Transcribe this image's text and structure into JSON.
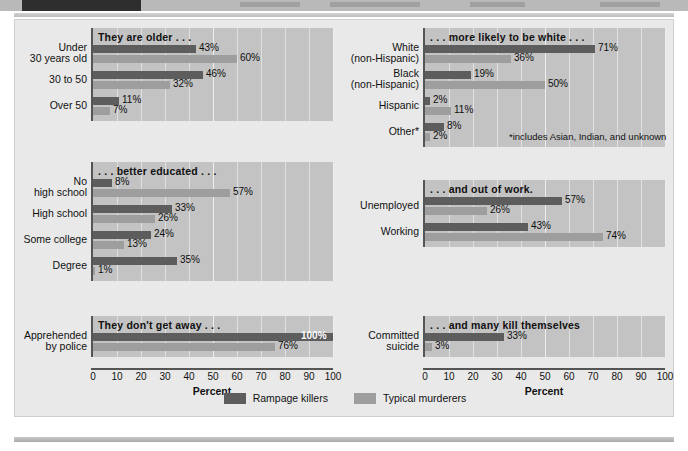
{
  "banner": {
    "title_unreadable": ""
  },
  "chart_data": {
    "type": "bar",
    "title": "",
    "xlabel": "Percent",
    "ylabel": "",
    "xlim": [
      0,
      100
    ],
    "grid": true,
    "orientation": "horizontal",
    "legend_position": "bottom-center",
    "series": [
      {
        "name": "Rampage killers",
        "color": "#5d5d5d"
      },
      {
        "name": "Typical murderers",
        "color": "#9e9e9e"
      }
    ],
    "ticks": [
      "0",
      "10",
      "20",
      "30",
      "40",
      "50",
      "60",
      "70",
      "80",
      "90",
      "100"
    ],
    "panels": [
      {
        "id": "age",
        "column": "left",
        "section_title": "They are older . . .",
        "categories": [
          {
            "label_lines": [
              "Under",
              "30 years old"
            ],
            "rampage": 43,
            "typical": 60,
            "rampage_text": "43%",
            "typical_text": "60%"
          },
          {
            "label_lines": [
              "30 to 50"
            ],
            "rampage": 46,
            "typical": 32,
            "rampage_text": "46%",
            "typical_text": "32%"
          },
          {
            "label_lines": [
              "Over 50"
            ],
            "rampage": 11,
            "typical": 7,
            "rampage_text": "11%",
            "typical_text": "7%"
          }
        ]
      },
      {
        "id": "education",
        "column": "left",
        "section_title": ". . . better educated . . .",
        "categories": [
          {
            "label_lines": [
              "No",
              "high school"
            ],
            "rampage": 8,
            "typical": 57,
            "rampage_text": "8%",
            "typical_text": "57%"
          },
          {
            "label_lines": [
              "High school"
            ],
            "rampage": 33,
            "typical": 26,
            "rampage_text": "33%",
            "typical_text": "26%"
          },
          {
            "label_lines": [
              "Some college"
            ],
            "rampage": 24,
            "typical": 13,
            "rampage_text": "24%",
            "typical_text": "13%"
          },
          {
            "label_lines": [
              "Degree"
            ],
            "rampage": 35,
            "typical": 1,
            "rampage_text": "35%",
            "typical_text": "1%"
          }
        ]
      },
      {
        "id": "apprehension",
        "column": "left",
        "section_title": "They don't get away . . .",
        "categories": [
          {
            "label_lines": [
              "Apprehended",
              "by police"
            ],
            "rampage": 100,
            "typical": 76,
            "rampage_text": "100%",
            "typical_text": "76%",
            "rampage_label_inside": true
          }
        ]
      },
      {
        "id": "race",
        "column": "right",
        "section_title": ". . . more likely to be white . . .",
        "footnote": "*includes Asian, Indian, and unknown",
        "categories": [
          {
            "label_lines": [
              "White",
              "(non-Hispanic)"
            ],
            "rampage": 71,
            "typical": 36,
            "rampage_text": "71%",
            "typical_text": "36%"
          },
          {
            "label_lines": [
              "Black",
              "(non-Hispanic)"
            ],
            "rampage": 19,
            "typical": 50,
            "rampage_text": "19%",
            "typical_text": "50%"
          },
          {
            "label_lines": [
              "Hispanic"
            ],
            "rampage": 2,
            "typical": 11,
            "rampage_text": "2%",
            "typical_text": "11%"
          },
          {
            "label_lines": [
              "Other*"
            ],
            "rampage": 8,
            "typical": 2,
            "rampage_text": "8%",
            "typical_text": "2%"
          }
        ]
      },
      {
        "id": "employment",
        "column": "right",
        "section_title": ". . . and out of work.",
        "categories": [
          {
            "label_lines": [
              "Unemployed"
            ],
            "rampage": 57,
            "typical": 26,
            "rampage_text": "57%",
            "typical_text": "26%"
          },
          {
            "label_lines": [
              "Working"
            ],
            "rampage": 43,
            "typical": 74,
            "rampage_text": "43%",
            "typical_text": "74%"
          }
        ]
      },
      {
        "id": "suicide",
        "column": "right",
        "section_title": ". . . and many kill themselves",
        "categories": [
          {
            "label_lines": [
              "Committed",
              "suicide"
            ],
            "rampage": 33,
            "typical": 3,
            "rampage_text": "33%",
            "typical_text": "3%"
          }
        ]
      }
    ]
  },
  "axis": {
    "title": "Percent"
  },
  "legend": {
    "items": [
      {
        "label": "Rampage killers",
        "swatch": "dark"
      },
      {
        "label": "Typical murderers",
        "swatch": "light"
      }
    ]
  }
}
